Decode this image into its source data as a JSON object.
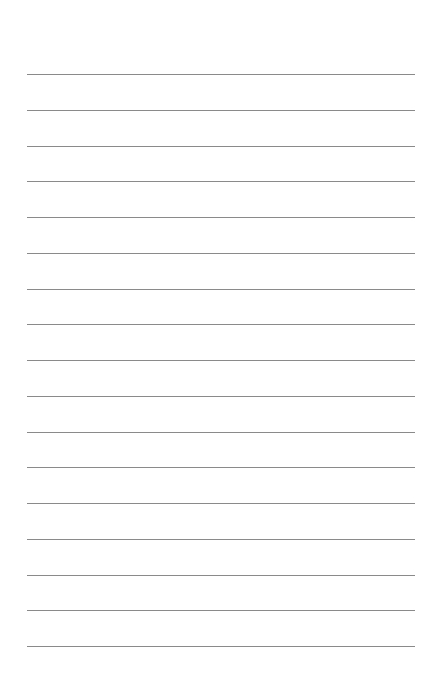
{
  "page": {
    "type": "lined-paper",
    "line_color": "#8a8a8a",
    "background": "#ffffff",
    "line_count": 17,
    "first_line_y": 74,
    "line_spacing": 35.75,
    "line_left": 27,
    "line_width": 388
  }
}
